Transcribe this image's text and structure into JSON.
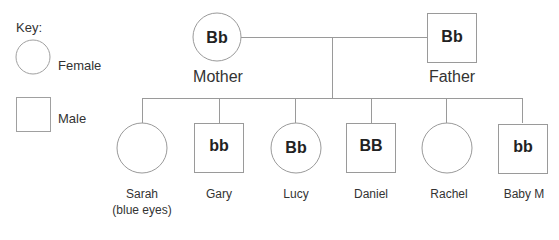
{
  "key": {
    "title": "Key:",
    "female_label": "Female",
    "male_label": "Male"
  },
  "parents": {
    "mother": {
      "name": "Mother",
      "genotype": "Bb",
      "shape": "circle"
    },
    "father": {
      "name": "Father",
      "genotype": "Bb",
      "shape": "square"
    }
  },
  "children": [
    {
      "name": "Sarah",
      "note": "(blue eyes)",
      "genotype": "",
      "shape": "circle"
    },
    {
      "name": "Gary",
      "note": "",
      "genotype": "bb",
      "shape": "square"
    },
    {
      "name": "Lucy",
      "note": "",
      "genotype": "Bb",
      "shape": "circle"
    },
    {
      "name": "Daniel",
      "note": "",
      "genotype": "BB",
      "shape": "square"
    },
    {
      "name": "Rachel",
      "note": "",
      "genotype": "",
      "shape": "circle"
    },
    {
      "name": "Baby M",
      "note": "",
      "genotype": "bb",
      "shape": "square"
    }
  ],
  "colors": {
    "line": "#9a9a9a",
    "text": "#333333"
  }
}
